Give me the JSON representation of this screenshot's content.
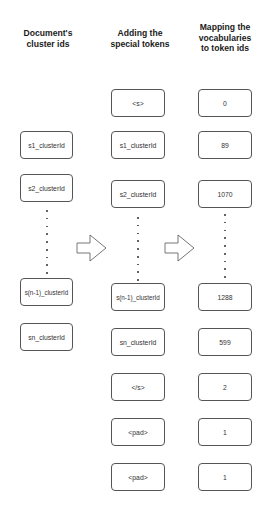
{
  "headers": [
    {
      "line1": "Document's",
      "line2": "cluster ids",
      "line3": ""
    },
    {
      "line1": "Adding the",
      "line2": "special tokens",
      "line3": ""
    },
    {
      "line1": "Mapping the",
      "line2": "vocabularies",
      "line3": "to token ids"
    }
  ],
  "column1": {
    "items": [
      "s1_clusterId",
      "s2_clusterId",
      "s(n-1)_clusterId",
      "sn_clusterId"
    ]
  },
  "column2": {
    "items": [
      "<s>",
      "s1_clusterId",
      "s2_clusterId",
      "s(n-1)_clusterId",
      "sn_clusterId",
      "</s>",
      "<pad>",
      "<pad>"
    ]
  },
  "column3": {
    "items": [
      "0",
      "89",
      "1070",
      "1288",
      "599",
      "2",
      "1",
      "1"
    ]
  },
  "arrows": [
    "arrow-right-icon",
    "arrow-right-icon"
  ],
  "colors": {
    "border": "#555555",
    "text": "#333333",
    "background": "#ffffff"
  }
}
